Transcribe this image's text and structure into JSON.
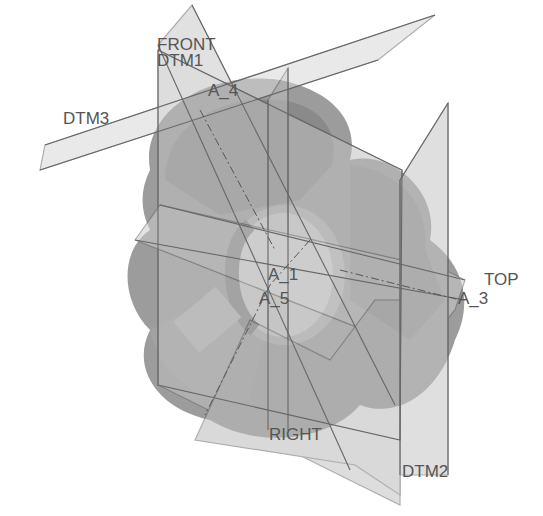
{
  "view": {
    "type": "cad-model-3d-view",
    "colors": {
      "background": "#ffffff",
      "solid_dark": "#8a8a8a",
      "solid_mid": "#a6a6a6",
      "solid_light": "#c8c8c8",
      "plane_fill": "#cfcfcf",
      "edge": "#666666",
      "label": "#555555"
    }
  },
  "datum_planes": [
    {
      "id": "front",
      "label": "FRONT"
    },
    {
      "id": "dtm1",
      "label": "DTM1"
    },
    {
      "id": "dtm3",
      "label": "DTM3"
    },
    {
      "id": "top",
      "label": "TOP"
    },
    {
      "id": "right",
      "label": "RIGHT"
    },
    {
      "id": "dtm2",
      "label": "DTM2"
    }
  ],
  "datum_axes": [
    {
      "id": "a4",
      "label": "A_4"
    },
    {
      "id": "a1",
      "label": "A_1"
    },
    {
      "id": "a5",
      "label": "A_5"
    },
    {
      "id": "a3",
      "label": "A_3"
    }
  ]
}
